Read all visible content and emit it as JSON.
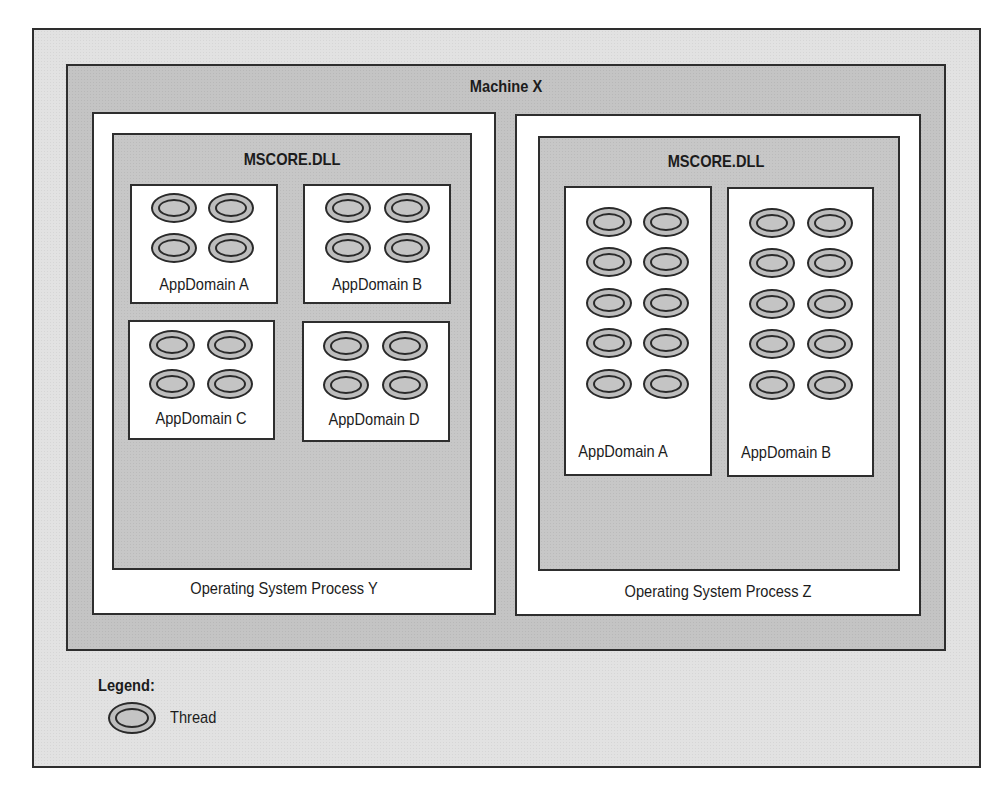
{
  "diagram": {
    "machine": {
      "label": "Machine X"
    },
    "processes": [
      {
        "id": "Y",
        "label": "Operating System Process Y",
        "runtime": {
          "label": "MSCORE.DLL"
        },
        "appdomains": [
          {
            "label": "AppDomain A",
            "threads": 4
          },
          {
            "label": "AppDomain B",
            "threads": 4
          },
          {
            "label": "AppDomain C",
            "threads": 4
          },
          {
            "label": "AppDomain D",
            "threads": 4
          }
        ]
      },
      {
        "id": "Z",
        "label": "Operating System Process Z",
        "runtime": {
          "label": "MSCORE.DLL"
        },
        "appdomains": [
          {
            "label": "AppDomain A",
            "threads": 10
          },
          {
            "label": "AppDomain B",
            "threads": 10
          }
        ]
      }
    ],
    "legend": {
      "title": "Legend:",
      "items": [
        {
          "icon": "thread-ellipse-icon",
          "label": "Thread"
        }
      ]
    },
    "colors": {
      "outer_background": "#e2e2e2",
      "machine_background": "#c4c4c4",
      "process_background": "#ffffff",
      "runtime_background": "#c7c7c7",
      "appdomain_background": "#ffffff",
      "thread_fill": "#bdbdbd",
      "border": "#2e2e2e"
    }
  }
}
